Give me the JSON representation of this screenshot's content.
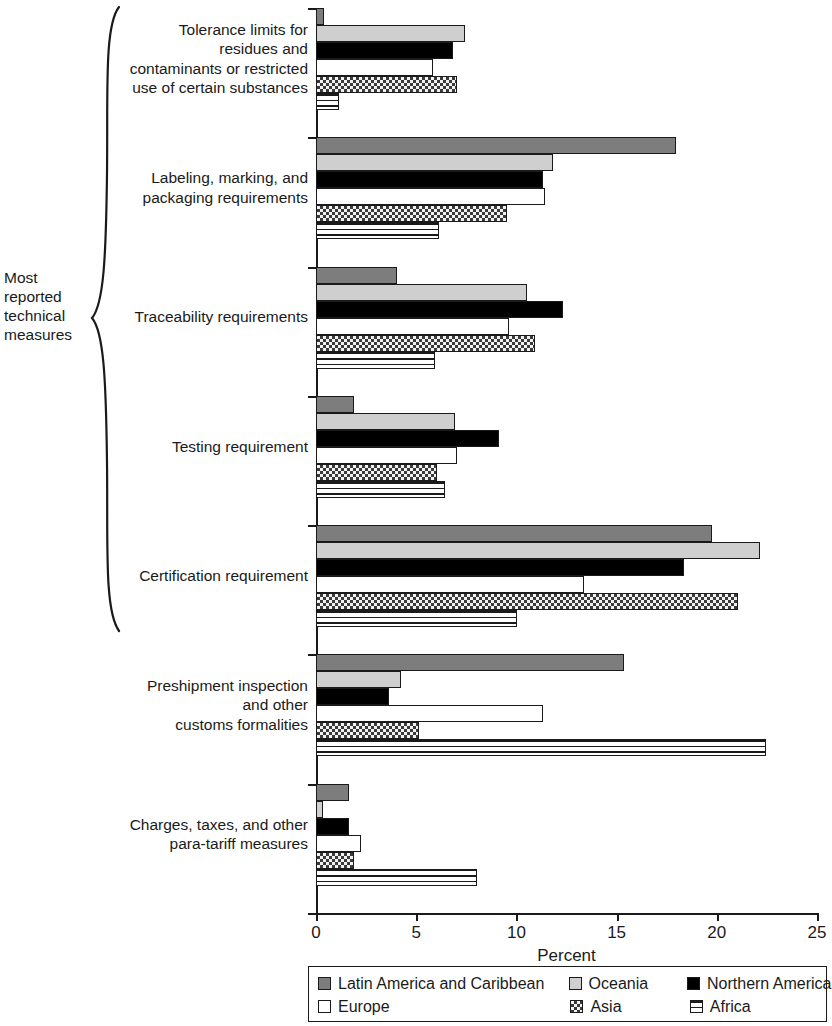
{
  "chart_data": {
    "type": "bar",
    "orientation": "horizontal",
    "title": "",
    "xlabel": "Percent",
    "ylabel": "",
    "xlim": [
      0,
      25
    ],
    "xticks": [
      0,
      5,
      10,
      15,
      20,
      25
    ],
    "grid": false,
    "legend_position": "bottom",
    "categories": [
      "Tolerance limits for\nresidues and\ncontaminants or restricted\nuse of certain substances",
      "Labeling, marking, and\npackaging requirements",
      "Traceability requirements",
      "Testing requirement",
      "Certification requirement",
      "Preshipment inspection\nand other\ncustoms formalities",
      "Charges, taxes, and other\npara-tariff measures"
    ],
    "series": [
      {
        "name": "Latin America and Caribbean",
        "pattern": "solid-dark-gray",
        "color": "#7d7d7d",
        "values": [
          0.35,
          17.9,
          4.0,
          1.85,
          19.7,
          15.3,
          1.6
        ]
      },
      {
        "name": "Oceania",
        "pattern": "solid-light-gray",
        "color": "#cfcfcf",
        "values": [
          7.4,
          11.8,
          10.5,
          6.9,
          22.1,
          4.2,
          0.3
        ]
      },
      {
        "name": "Northern America",
        "pattern": "solid-black",
        "color": "#000000",
        "values": [
          6.8,
          11.3,
          12.3,
          9.1,
          18.3,
          3.6,
          1.6
        ]
      },
      {
        "name": "Europe",
        "pattern": "open-white",
        "color": "#ffffff",
        "values": [
          5.8,
          11.4,
          9.6,
          7.0,
          13.3,
          11.3,
          2.2
        ]
      },
      {
        "name": "Asia",
        "pattern": "checkerboard",
        "color": "#f2f2f2",
        "values": [
          7.0,
          9.5,
          10.9,
          6.0,
          21.0,
          5.1,
          1.85
        ]
      },
      {
        "name": "Africa",
        "pattern": "horizontal-stripes",
        "color": "#ffffff",
        "values": [
          1.1,
          6.1,
          5.9,
          6.4,
          10.0,
          22.4,
          8.0
        ]
      }
    ]
  },
  "annotation": {
    "group_caption": "Most\nreported\ntechnical\nmeasures",
    "group_caption_covers": [
      "Tolerance limits for residues and contaminants or restricted use of certain substances",
      "Labeling, marking, and packaging requirements",
      "Traceability requirements",
      "Testing requirement",
      "Certification requirement"
    ]
  },
  "axis": {
    "x_title": "Percent",
    "tick_labels": [
      "0",
      "5",
      "10",
      "15",
      "20",
      "25"
    ]
  },
  "legend": {
    "entries": [
      "Latin America and Caribbean",
      "Oceania",
      "Northern America",
      "Europe",
      "Asia",
      "Africa"
    ]
  }
}
